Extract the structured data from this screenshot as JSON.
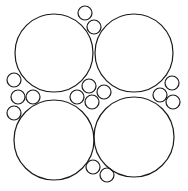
{
  "diagram": {
    "type": "circle-packing",
    "width": 188,
    "height": 191,
    "stroke_color": "#1a1a1a",
    "background": "#ffffff",
    "large_circles": [
      {
        "name": "top-left",
        "cx": 54,
        "cy": 53,
        "r": 39
      },
      {
        "name": "top-right",
        "cx": 134,
        "cy": 53,
        "r": 39
      },
      {
        "name": "bottom-left",
        "cx": 54,
        "cy": 140,
        "r": 40
      },
      {
        "name": "bottom-right",
        "cx": 134,
        "cy": 137,
        "r": 40
      }
    ],
    "small_circles": [
      {
        "group": "top",
        "cx": 85,
        "cy": 13,
        "r": 7
      },
      {
        "group": "top",
        "cx": 94,
        "cy": 27,
        "r": 7
      },
      {
        "group": "left",
        "cx": 14,
        "cy": 80,
        "r": 7
      },
      {
        "group": "left",
        "cx": 18,
        "cy": 97,
        "r": 7
      },
      {
        "group": "left",
        "cx": 33,
        "cy": 97,
        "r": 7
      },
      {
        "group": "left",
        "cx": 14,
        "cy": 113,
        "r": 7
      },
      {
        "group": "center",
        "cx": 77,
        "cy": 97,
        "r": 7
      },
      {
        "group": "center",
        "cx": 89,
        "cy": 86,
        "r": 7
      },
      {
        "group": "center",
        "cx": 104,
        "cy": 92,
        "r": 7
      },
      {
        "group": "center",
        "cx": 92,
        "cy": 102,
        "r": 7
      },
      {
        "group": "right",
        "cx": 172,
        "cy": 83,
        "r": 7
      },
      {
        "group": "right",
        "cx": 160,
        "cy": 95,
        "r": 7
      },
      {
        "group": "right",
        "cx": 173,
        "cy": 102,
        "r": 7
      },
      {
        "group": "bottom",
        "cx": 93,
        "cy": 167,
        "r": 7
      },
      {
        "group": "bottom",
        "cx": 107,
        "cy": 175,
        "r": 7
      }
    ]
  }
}
